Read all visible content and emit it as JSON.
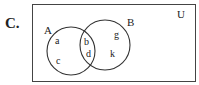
{
  "problem_label": "C.",
  "universe_label": "U",
  "sets": [
    {
      "name": "A",
      "cx": 71,
      "cy": 51,
      "r": 24
    },
    {
      "name": "B",
      "cx": 105,
      "cy": 45,
      "r": 25
    }
  ],
  "elements": {
    "a": "a",
    "c": "c",
    "b": "b",
    "d": "d",
    "g": "g",
    "k": "k"
  },
  "regions": {
    "A_only": [
      "a",
      "c"
    ],
    "A_and_B": [
      "b",
      "d"
    ],
    "B_only": [
      "g",
      "k"
    ]
  },
  "colors": {
    "stroke": "#333333",
    "text": "#222222"
  }
}
